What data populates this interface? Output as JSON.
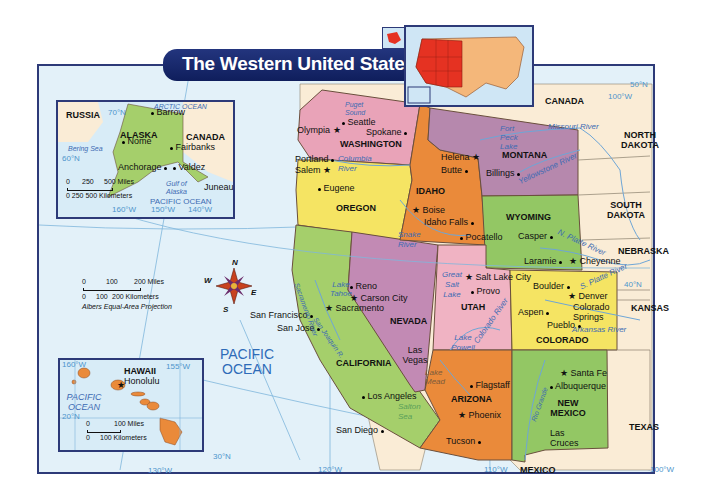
{
  "title": "The Western United States",
  "colors": {
    "ocean": "#e3f1f9",
    "banner": "#1a2a6c",
    "washington": "#e9a3b8",
    "oregon": "#f5e463",
    "california": "#a5cf6b",
    "nevada": "#c28ab4",
    "idaho": "#ea8a3a",
    "montana": "#b688ad",
    "wyoming": "#93c764",
    "utah": "#f0b3c3",
    "colorado": "#f5e463",
    "arizona": "#ea8a3a",
    "new_mexico": "#93c764",
    "non_western": "#faecd6",
    "highlight_west": "#e53222",
    "highlight_rest": "#f4b77a"
  },
  "states": [
    {
      "name": "WASHINGTON"
    },
    {
      "name": "OREGON"
    },
    {
      "name": "CALIFORNIA"
    },
    {
      "name": "NEVADA"
    },
    {
      "name": "IDAHO"
    },
    {
      "name": "MONTANA"
    },
    {
      "name": "WYOMING"
    },
    {
      "name": "UTAH"
    },
    {
      "name": "COLORADO"
    },
    {
      "name": "ARIZONA"
    },
    {
      "name": "NEW MEXICO"
    }
  ],
  "neighbors": {
    "canada": "CANADA",
    "north_dakota": "NORTH DAKOTA",
    "south_dakota": "SOUTH DAKOTA",
    "nebraska": "NEBRASKA",
    "kansas": "KANSAS",
    "texas": "TEXAS",
    "mexico": "MEXICO"
  },
  "cities": {
    "seattle": "Seattle",
    "olympia": "Olympia",
    "spokane": "Spokane",
    "portland": "Portland",
    "salem": "Salem",
    "eugene": "Eugene",
    "helena": "Helena",
    "butte": "Butte",
    "billings": "Billings",
    "boise": "Boise",
    "idaho_falls": "Idaho Falls",
    "pocatello": "Pocatello",
    "casper": "Casper",
    "laramie": "Laramie",
    "cheyenne": "Cheyenne",
    "salt_lake_city": "Salt Lake City",
    "provo": "Provo",
    "reno": "Reno",
    "carson_city": "Carson City",
    "sacramento": "Sacramento",
    "san_francisco": "San Francisco",
    "san_jose": "San Jose",
    "las_vegas": "Las Vegas",
    "los_angeles": "Los Angeles",
    "san_diego": "San Diego",
    "boulder": "Boulder",
    "denver": "Denver",
    "colorado_springs": "Colorado Springs",
    "aspen": "Aspen",
    "pueblo": "Pueblo",
    "flagstaff": "Flagstaff",
    "phoenix": "Phoenix",
    "tucson": "Tucson",
    "santa_fe": "Santa Fe",
    "albuquerque": "Albuquerque",
    "las_cruces": "Las Cruces"
  },
  "water": {
    "puget_sound": "Puget Sound",
    "columbia_river": "Columbia River",
    "snake_river": "Snake River",
    "fort_peck_lake": "Fort Peck Lake",
    "missouri_river": "Missouri River",
    "yellowstone_river": "Yellowstone River",
    "n_platte_river": "N. Platte River",
    "s_platte_river": "S. Platte River",
    "great_salt_lake": "Great Salt Lake",
    "lake_tahoe": "Lake Tahoe",
    "sacramento_river": "Sacramento River",
    "san_joaquin_river": "San Joaquin R.",
    "colorado_river": "Colorado River",
    "lake_powell": "Lake Powell",
    "lake_mead": "Lake Mead",
    "arkansas_river": "Arkansas River",
    "salton_sea": "Salton Sea",
    "rio_grande": "Rio Grande",
    "pacific_ocean": "PACIFIC OCEAN"
  },
  "grid_labels": {
    "lat_50": "50°N",
    "lat_40": "40°N",
    "lat_30": "30°N",
    "lon_100_top": "100°W",
    "lon_100_bottom": "100°W",
    "lon_110": "110°W",
    "lon_120": "120°W",
    "lon_130": "130°W"
  },
  "compass": {
    "n": "N",
    "s": "S",
    "e": "E",
    "w": "W"
  },
  "scale": {
    "miles_ticks": [
      "0",
      "100",
      "200 Miles"
    ],
    "km_ticks": [
      "0",
      "100",
      "200 Kilometers"
    ],
    "projection": "Albers Equal-Area Projection"
  },
  "alaska_inset": {
    "russia": "RUSSIA",
    "canada": "CANADA",
    "state": "ALASKA",
    "cities": [
      "Barrow",
      "Nome",
      "Fairbanks",
      "Anchorage",
      "Valdez",
      "Juneau"
    ],
    "arctic_ocean": "ARCTIC OCEAN",
    "bering_sea": "Bering Sea",
    "gulf_of_alaska": "Gulf of Alaska",
    "pacific_ocean": "PACIFIC OCEAN",
    "lat_70": "70°N",
    "lat_60": "60°N",
    "lon_160": "160°W",
    "lon_150": "150°W",
    "lon_140": "140°W",
    "scale_miles": [
      "0",
      "250",
      "500 Miles"
    ],
    "scale_km": "0 250 500 Kilometers"
  },
  "hawaii_inset": {
    "state": "HAWAII",
    "capital": "Honolulu",
    "ocean": "PACIFIC OCEAN",
    "lon_160": "160°W",
    "lon_155": "155°W",
    "lat_20": "20°N",
    "scale_miles": [
      "0",
      "100 Miles"
    ],
    "scale_km": [
      "0",
      "100 Kilometers"
    ]
  }
}
